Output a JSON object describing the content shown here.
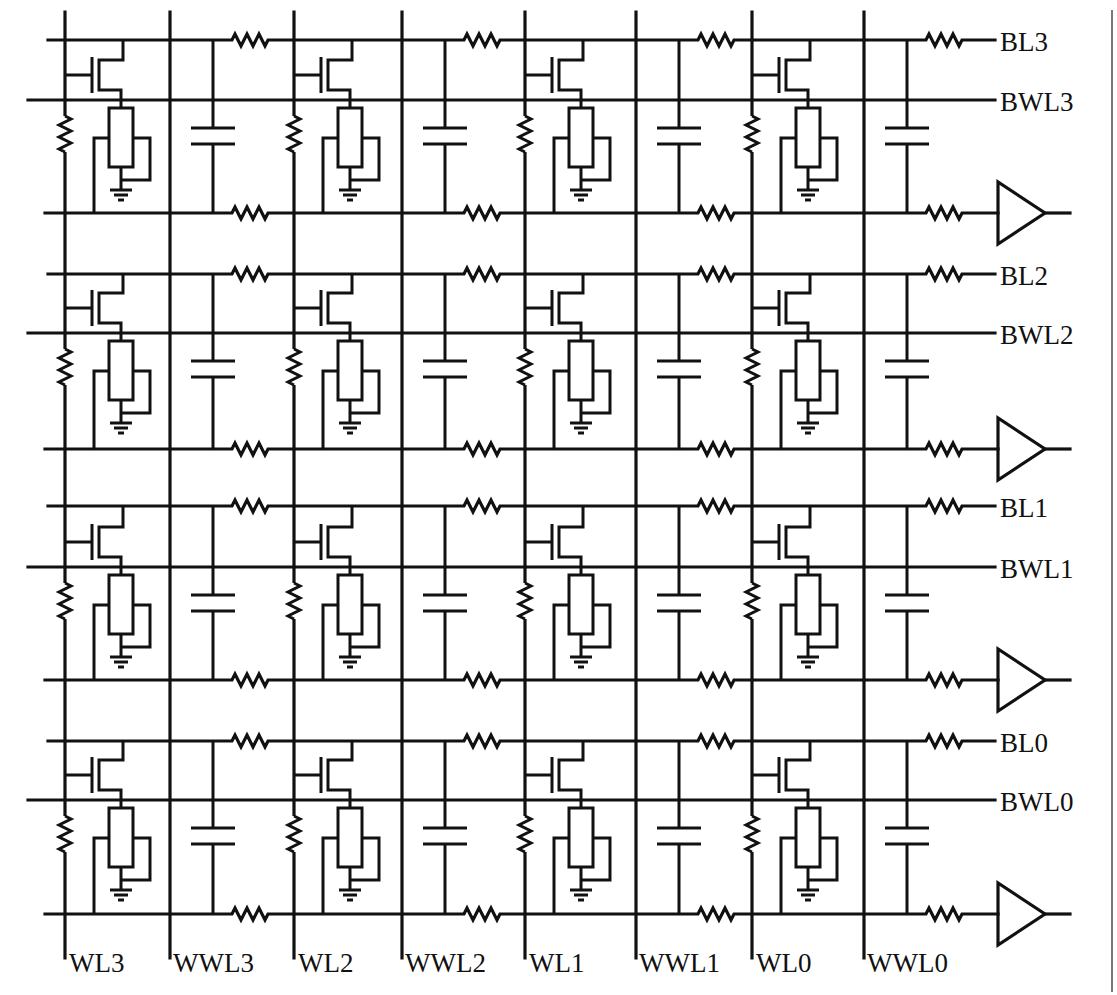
{
  "diagram": {
    "column_labels": [
      "WL3",
      "WWL3",
      "WL2",
      "WWL2",
      "WL1",
      "WWL1",
      "WL0",
      "WWL0"
    ],
    "row_labels": [
      {
        "bl": "BL3",
        "bwl": "BWL3"
      },
      {
        "bl": "BL2",
        "bwl": "BWL2"
      },
      {
        "bl": "BL1",
        "bwl": "BWL1"
      },
      {
        "bl": "BL0",
        "bwl": "BWL0"
      }
    ],
    "components_per_cell": [
      "access-transistor",
      "memristor",
      "ground",
      "wordline-resistor",
      "coupling-capacitor",
      "line-resistor"
    ],
    "output_element": "sense-amplifier",
    "colors": {
      "line": "#111111",
      "border": "#7a7a7a",
      "background": "#ffffff"
    }
  },
  "geometry": {
    "wl_x": [
      65,
      294,
      525,
      752
    ],
    "wwl_x": [
      170,
      402,
      636,
      864
    ],
    "rows": [
      {
        "bl": 40,
        "bwl": 100,
        "bot": 213
      },
      {
        "bl": 274,
        "bwl": 333,
        "bot": 449
      },
      {
        "bl": 506,
        "bwl": 567,
        "bot": 680
      },
      {
        "bl": 741,
        "bwl": 800,
        "bot": 914
      }
    ]
  }
}
